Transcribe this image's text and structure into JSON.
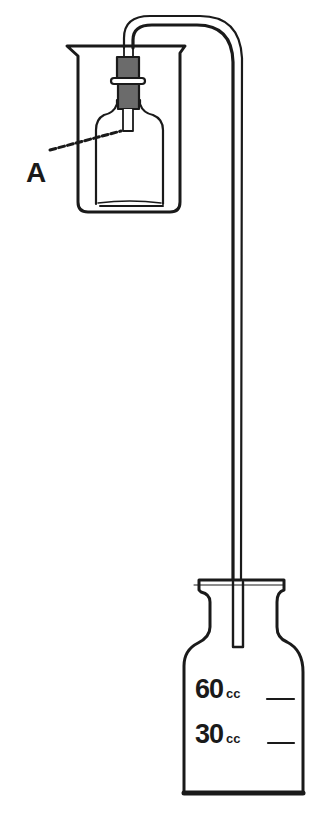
{
  "diagram": {
    "labels": {
      "a": "A"
    },
    "graduations": [
      {
        "value": "60",
        "unit": "cc"
      },
      {
        "value": "30",
        "unit": "cc"
      }
    ],
    "components": [
      "beaker",
      "small-bottle",
      "stopper",
      "inner-tube-A",
      "siphon-tube",
      "collecting-bottle"
    ],
    "colors": {
      "ink": "#1a1a1a",
      "background": "#ffffff"
    }
  }
}
